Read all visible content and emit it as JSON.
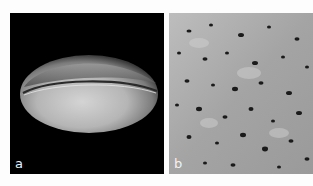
{
  "figure": {
    "panels": [
      {
        "id": "a",
        "label": "a",
        "description": "SEM image of a prolate pollen grain with a single longitudinal furrow on a black background"
      },
      {
        "id": "b",
        "label": "b",
        "description": "SEM close-up of perforate exine surface texture"
      }
    ],
    "colors": {
      "background": "#fdfdfd",
      "panel_a_background": "#000000",
      "panel_b_surface": "#a9a9a9",
      "grain_light": "#d8d8d8",
      "grain_shadow": "#5a5a5a",
      "label_text": "#f2f2f2"
    }
  }
}
